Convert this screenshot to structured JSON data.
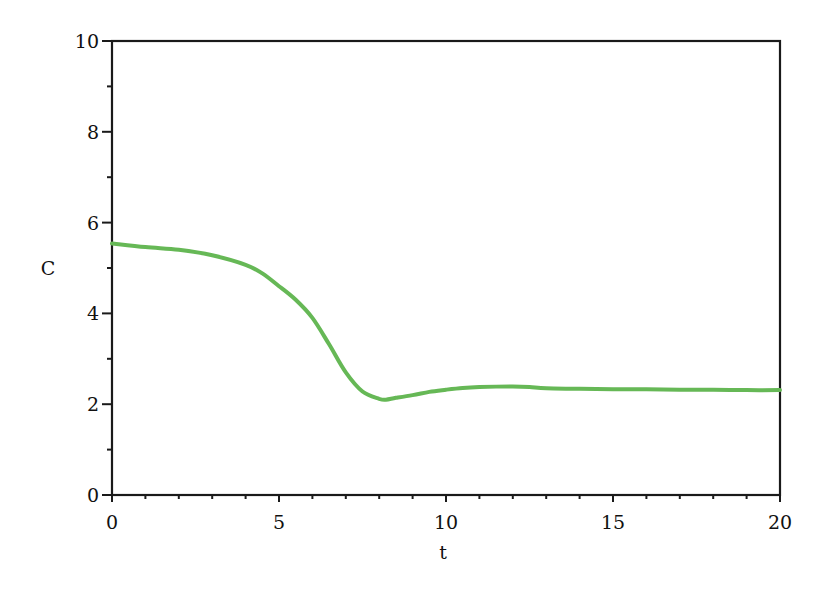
{
  "chart_data": {
    "type": "line",
    "title": "",
    "xlabel": "t",
    "ylabel": "C",
    "xlim": [
      0,
      20
    ],
    "ylim": [
      0,
      10
    ],
    "x_major_ticks": [
      0,
      5,
      10,
      15,
      20
    ],
    "x_tick_labels": [
      "0",
      "5",
      "10",
      "15",
      "20"
    ],
    "x_minor_step": 1,
    "y_major_ticks": [
      0,
      2,
      4,
      6,
      8,
      10
    ],
    "y_tick_labels": [
      "0",
      "2",
      "4",
      "6",
      "8",
      "10"
    ],
    "y_minor_step": 1,
    "grid": false,
    "legend": null,
    "series": [
      {
        "name": "C(t)",
        "color": "#66b856",
        "x": [
          0,
          1,
          2,
          3,
          4,
          4.5,
          5,
          5.5,
          6,
          6.5,
          7,
          7.5,
          8,
          8.2,
          8.5,
          9,
          9.5,
          10,
          10.5,
          11,
          12,
          12.5,
          13,
          14,
          15,
          16,
          17,
          18,
          19,
          20
        ],
        "y": [
          5.54,
          5.46,
          5.4,
          5.28,
          5.07,
          4.88,
          4.6,
          4.3,
          3.9,
          3.32,
          2.7,
          2.28,
          2.12,
          2.1,
          2.14,
          2.2,
          2.27,
          2.32,
          2.36,
          2.38,
          2.39,
          2.38,
          2.35,
          2.34,
          2.33,
          2.33,
          2.32,
          2.32,
          2.31,
          2.31
        ]
      }
    ]
  },
  "layout": {
    "plot_left": 112,
    "plot_right": 780,
    "plot_top": 41,
    "plot_bottom": 495
  }
}
